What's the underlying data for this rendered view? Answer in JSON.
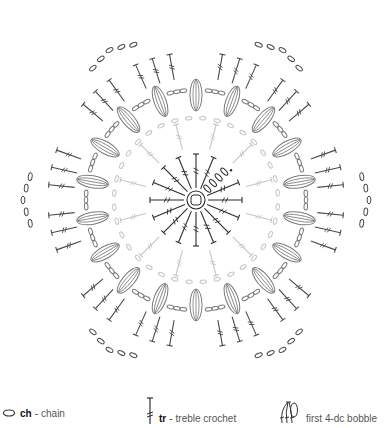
{
  "diagram": {
    "center": [
      196,
      200
    ],
    "colors": {
      "round1": "#2b2b2b",
      "round2": "#c4c4c4",
      "round3": "#7a7a7a",
      "round4": "#4a4a4a"
    },
    "rounds": [
      {
        "name": "round-1",
        "ring_radius": 9,
        "stitch": "tr",
        "count": 16,
        "inner": 12,
        "outer": 46,
        "start_chain_links": 4
      },
      {
        "name": "round-2",
        "stitch": "tr-ch",
        "count": 12,
        "inner": 52,
        "outer": 86,
        "chain_radius": 92
      },
      {
        "name": "round-3",
        "stitch": "bobble-ch",
        "count": 18,
        "radius": 105,
        "chain_radius": 112
      },
      {
        "name": "round-4",
        "stitch": "tr-clusters",
        "groups": 12,
        "per_group": 3,
        "inner": 118,
        "outer": 158,
        "corner_chain_radius": 165
      }
    ]
  },
  "legend": {
    "items": [
      {
        "symbol": "chain-oval",
        "abbr": "ch",
        "separator": "-",
        "label": "chain"
      },
      {
        "symbol": "treble-crochet",
        "abbr": "tr",
        "separator": "-",
        "label": "treble crochet"
      },
      {
        "symbol": "bobble",
        "abbr": "",
        "separator": "",
        "label": "first 4-dc bobble"
      }
    ]
  }
}
